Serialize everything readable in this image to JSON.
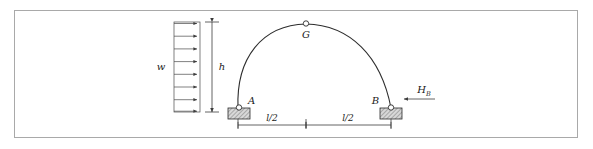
{
  "figure": {
    "type": "three-hinged-arch-diagram",
    "background_color": "#ffffff",
    "border_color": "#a9a9a9",
    "line_color": "#2e2e2e"
  },
  "labels": {
    "load": "w",
    "height": "h",
    "crown_hinge": "G",
    "support_left": "A",
    "support_right": "B",
    "reaction_symbol": "H",
    "reaction_subscript": "B",
    "span_left": "l/2",
    "span_right": "l/2"
  },
  "geometry": {
    "arch": {
      "left_support_x": 238,
      "left_support_y": 108,
      "crown_x": 306,
      "crown_y": 24,
      "right_support_x": 391,
      "right_support_y": 108
    },
    "load_box": {
      "left_x": 174,
      "right_x": 200,
      "top_y": 22,
      "bottom_y": 112,
      "arrow_count": 8,
      "direction": "right"
    },
    "height_dimension": {
      "x": 212,
      "top_y": 22,
      "bottom_y": 112
    },
    "span_dimension": {
      "y": 125,
      "left_x": 238,
      "mid_x": 306,
      "right_x": 391
    },
    "reaction_arrow": {
      "tail_x": 435,
      "head_x": 400,
      "y": 99,
      "direction": "left"
    }
  },
  "icons": {
    "hinge": "hinge-circle-icon",
    "support": "fixed-support-hatch-icon",
    "arrow": "arrow-head-icon"
  }
}
